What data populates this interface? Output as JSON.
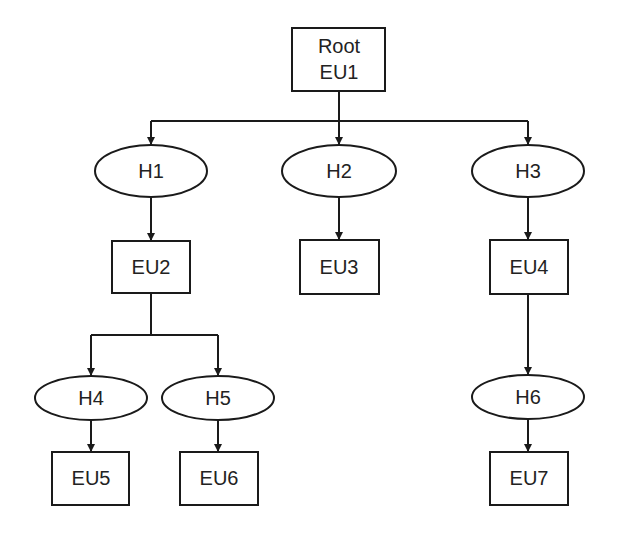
{
  "diagram": {
    "type": "tree",
    "colors": {
      "stroke": "#1a1a1a",
      "text": "#222222",
      "background": "#ffffff"
    },
    "nodes": {
      "eu1": {
        "line1": "Root",
        "line2": "EU1",
        "shape": "rectangle"
      },
      "h1": {
        "label": "H1",
        "shape": "ellipse"
      },
      "h2": {
        "label": "H2",
        "shape": "ellipse"
      },
      "h3": {
        "label": "H3",
        "shape": "ellipse"
      },
      "eu2": {
        "label": "EU2",
        "shape": "rectangle"
      },
      "eu3": {
        "label": "EU3",
        "shape": "rectangle"
      },
      "eu4": {
        "label": "EU4",
        "shape": "rectangle"
      },
      "h4": {
        "label": "H4",
        "shape": "ellipse"
      },
      "h5": {
        "label": "H5",
        "shape": "ellipse"
      },
      "h6": {
        "label": "H6",
        "shape": "ellipse"
      },
      "eu5": {
        "label": "EU5",
        "shape": "rectangle"
      },
      "eu6": {
        "label": "EU6",
        "shape": "rectangle"
      },
      "eu7": {
        "label": "EU7",
        "shape": "rectangle"
      }
    },
    "edges": [
      [
        "EU1",
        "H1"
      ],
      [
        "EU1",
        "H2"
      ],
      [
        "EU1",
        "H3"
      ],
      [
        "H1",
        "EU2"
      ],
      [
        "H2",
        "EU3"
      ],
      [
        "H3",
        "EU4"
      ],
      [
        "EU2",
        "H4"
      ],
      [
        "EU2",
        "H5"
      ],
      [
        "EU4",
        "H6"
      ],
      [
        "H4",
        "EU5"
      ],
      [
        "H5",
        "EU6"
      ],
      [
        "H6",
        "EU7"
      ]
    ]
  }
}
